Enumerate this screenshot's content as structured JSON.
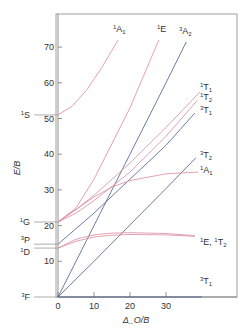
{
  "chart_data": {
    "type": "line",
    "title": "",
    "xlabel": "Δ_O/B",
    "ylabel": "E/B",
    "xlim": [
      0,
      40
    ],
    "ylim": [
      0,
      75
    ],
    "xticks": [
      0,
      10,
      20,
      30
    ],
    "yticks": [
      10,
      20,
      30,
      40,
      50,
      60,
      70
    ],
    "grid": false,
    "free_ion_terms": [
      {
        "label": "³F",
        "sup": "3",
        "base": "F",
        "sub": "",
        "y": 0
      },
      {
        "label": "¹D",
        "sup": "1",
        "base": "D",
        "sub": "",
        "y": 13.7
      },
      {
        "label": "³P",
        "sup": "3",
        "base": "P",
        "sub": "",
        "y": 14.8
      },
      {
        "label": "¹G",
        "sup": "1",
        "base": "G",
        "sub": "",
        "y": 21
      },
      {
        "label": "¹S",
        "sup": "1",
        "base": "S",
        "sub": "",
        "y": 51
      }
    ],
    "series": [
      {
        "name": "3T1-ground",
        "sup": "3",
        "base": "T",
        "sub": "1",
        "spin": "triplet",
        "color": "#4a5a8c",
        "x": [
          0,
          40
        ],
        "y": [
          0,
          0
        ],
        "label_pos": "bottom-right"
      },
      {
        "name": "3T2",
        "sup": "3",
        "base": "T",
        "sub": "2",
        "spin": "triplet",
        "color": "#4a5a8c",
        "x": [
          0,
          10,
          20,
          30,
          38.3
        ],
        "y": [
          0,
          10,
          20.2,
          30.4,
          39
        ]
      },
      {
        "name": "3A2",
        "sup": "3",
        "base": "A",
        "sub": "2",
        "spin": "triplet",
        "color": "#4a5a8c",
        "x": [
          0,
          10,
          20,
          30,
          35.6
        ],
        "y": [
          0,
          20,
          40,
          60,
          71.4
        ]
      },
      {
        "name": "3T1-P",
        "sup": "3",
        "base": "T",
        "sub": "1",
        "spin": "triplet",
        "color": "#4a5a8c",
        "x": [
          0,
          10,
          20,
          30,
          38
        ],
        "y": [
          14.8,
          23.5,
          33,
          42.5,
          51.5
        ]
      },
      {
        "name": "1D-1E",
        "sup": "1",
        "base": "E",
        "sub": "",
        "spin": "singlet",
        "color": "#d98a9e",
        "x": [
          0,
          5,
          10,
          15,
          20,
          30,
          38
        ],
        "y": [
          13.7,
          15.6,
          16.8,
          17.3,
          17.5,
          17.4,
          17
        ]
      },
      {
        "name": "1D-1T2",
        "sup": "1",
        "base": "T",
        "sub": "2",
        "spin": "singlet",
        "color": "#d98a9e",
        "x": [
          0,
          5,
          10,
          15,
          20,
          30,
          38
        ],
        "y": [
          13.7,
          16.2,
          17.4,
          17.9,
          18.0,
          17.8,
          17.2
        ],
        "label": "¹E, ¹T₂"
      },
      {
        "name": "1A1-lower",
        "sup": "1",
        "base": "A",
        "sub": "1",
        "spin": "singlet",
        "color": "#d98a9e",
        "x": [
          0,
          5,
          10,
          15,
          20,
          30,
          38.9
        ],
        "y": [
          21,
          24.5,
          28,
          30.8,
          32.6,
          34.5,
          35
        ]
      },
      {
        "name": "1T2-upper",
        "sup": "1",
        "base": "T",
        "sub": "2",
        "spin": "singlet",
        "color": "#d98a9e",
        "x": [
          0,
          5,
          10,
          20,
          30,
          38.6
        ],
        "y": [
          21,
          23.5,
          27,
          35,
          45,
          55
        ]
      },
      {
        "name": "1T1",
        "sup": "1",
        "base": "T",
        "sub": "1",
        "spin": "singlet",
        "color": "#d98a9e",
        "x": [
          0,
          5,
          10,
          20,
          30,
          39.4
        ],
        "y": [
          21,
          24.5,
          28.5,
          37.5,
          47.5,
          57.4
        ]
      },
      {
        "name": "1E-upper",
        "sup": "1",
        "base": "E",
        "sub": "",
        "spin": "singlet",
        "color": "#d98a9e",
        "x": [
          0,
          5,
          10,
          15,
          20,
          28
        ],
        "y": [
          21,
          25,
          33,
          43,
          53,
          72
        ]
      },
      {
        "name": "1A1-upper",
        "sup": "1",
        "base": "A",
        "sub": "1",
        "spin": "singlet",
        "color": "#d98a9e",
        "x": [
          0,
          4,
          8,
          12,
          16.7
        ],
        "y": [
          51,
          53.5,
          58,
          64,
          72
        ]
      }
    ]
  }
}
